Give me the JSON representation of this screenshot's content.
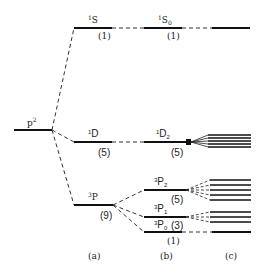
{
  "diagram": {
    "configuration": {
      "label": "p",
      "superscript": "2"
    },
    "terms": [
      {
        "id": "1S",
        "mult": "1",
        "letter": "S",
        "degeneracy": "(1)"
      },
      {
        "id": "1D",
        "mult": "1",
        "letter": "D",
        "degeneracy": "(5)"
      },
      {
        "id": "3P",
        "mult": "3",
        "letter": "P",
        "degeneracy": "(9)"
      }
    ],
    "levels": [
      {
        "id": "1S0",
        "mult": "1",
        "letter": "S",
        "J": "0",
        "degeneracy": "(1)",
        "sublevels": 1
      },
      {
        "id": "1D2",
        "mult": "1",
        "letter": "D",
        "J": "2",
        "degeneracy": "(5)",
        "sublevels": 5
      },
      {
        "id": "3P2",
        "mult": "3",
        "letter": "P",
        "J": "2",
        "degeneracy": "(5)",
        "sublevels": 5
      },
      {
        "id": "3P1",
        "mult": "3",
        "letter": "P",
        "J": "1",
        "degeneracy": "(3)",
        "sublevels": 3
      },
      {
        "id": "3P0",
        "mult": "3",
        "letter": "P",
        "J": "0",
        "degeneracy": "(1)",
        "sublevels": 1
      }
    ],
    "column_labels": [
      "(a)",
      "(b)",
      "(c)"
    ]
  }
}
